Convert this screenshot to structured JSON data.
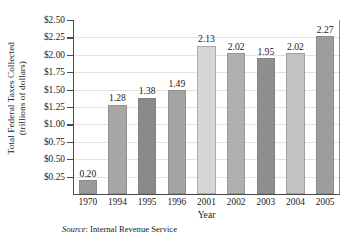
{
  "chart_data": {
    "type": "bar",
    "title": "",
    "xlabel": "Year",
    "ylabel_line1": "Total Federal Taxes Collected",
    "ylabel_line2": "(trillions of dollars)",
    "categories": [
      "1970",
      "1994",
      "1995",
      "1996",
      "2001",
      "2002",
      "2003",
      "2004",
      "2005"
    ],
    "values": [
      0.2,
      1.28,
      1.38,
      1.49,
      2.13,
      2.02,
      1.95,
      2.02,
      2.27
    ],
    "value_labels": [
      "0.20",
      "1.28",
      "1.38",
      "1.49",
      "2.13",
      "2.02",
      "1.95",
      "2.02",
      "2.27"
    ],
    "bar_colors": [
      "#9a9a9a",
      "#a7a7a7",
      "#8a8a8a",
      "#a4a4a4",
      "#d5d5d5",
      "#b0b0b0",
      "#8f8f8f",
      "#c2c2c2",
      "#9d9d9d"
    ],
    "ylim": [
      0.0,
      2.5
    ],
    "ytick_values": [
      0.25,
      0.5,
      0.75,
      1.0,
      1.25,
      1.5,
      1.75,
      2.0,
      2.25,
      2.5
    ],
    "ytick_labels": [
      "$0.25",
      "$0.50",
      "$0.75",
      "$1.00",
      "$1.25",
      "$1.50",
      "$1.75",
      "$2.00",
      "$2.25",
      "$2.50"
    ],
    "grid": "horizontal",
    "legend": "none",
    "axis_color": "#4a4a4a",
    "grid_color": "#e2e2e2"
  },
  "source": {
    "label": "Source",
    "separator": ": ",
    "text": "Internal Revenue Service"
  }
}
